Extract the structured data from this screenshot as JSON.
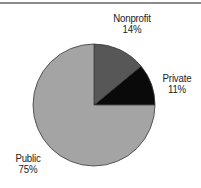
{
  "chart_data": {
    "type": "pie",
    "title": "",
    "categories": [
      "Private",
      "Nonprofit",
      "Public"
    ],
    "values": [
      11,
      14,
      75
    ],
    "unit": "%",
    "colors": [
      "#0a0a0a",
      "#575757",
      "#a4a4a4"
    ],
    "start_angle_deg": 0,
    "direction": "counterclockwise",
    "legend": "none (direct labels)",
    "labels": [
      {
        "name": "Private",
        "value_text": "11%"
      },
      {
        "name": "Nonprofit",
        "value_text": "14%"
      },
      {
        "name": "Public",
        "value_text": "75%"
      }
    ]
  },
  "geometry": {
    "cx": 94,
    "cy": 105,
    "r": 61,
    "stroke": "#3a3a3a"
  },
  "colors": {
    "rule": "#8c8c8c",
    "text": "#222222",
    "background": "#ffffff"
  }
}
